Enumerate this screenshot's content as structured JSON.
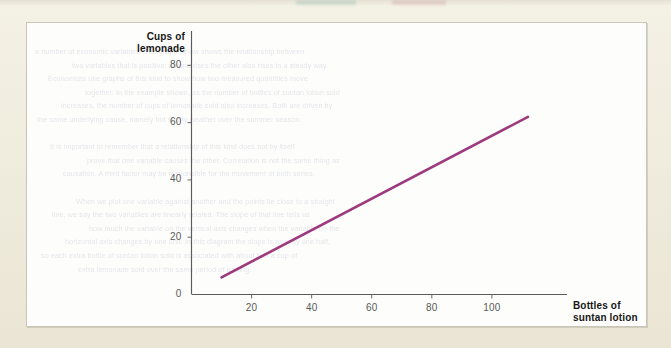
{
  "figure": {
    "background_color": "#f1eee1",
    "panel_color": "#fdfdfb",
    "panel_border_color": "#c9c6b9"
  },
  "axes": {
    "y_title_line1": "Cups of",
    "y_title_line2": "lemonade",
    "x_title_line1": "Bottles of",
    "x_title_line2": "suntan lotion",
    "y_ticks": [
      "0",
      "20",
      "40",
      "60",
      "80"
    ],
    "x_ticks": [
      "20",
      "40",
      "60",
      "80",
      "100"
    ],
    "axis_color": "#5c5c5c",
    "tick_label_color": "#5a5a5a",
    "title_color": "#171717"
  },
  "bleed_text": {
    "lines": [
      "a number of economic variables. The graph below shows the relationship between",
      "two variables that is positive: as one rises the other also rises in a steady way.",
      "Economists use graphs of this kind to show how two measured quantities move",
      "together. In the example shown, as the number of bottles of suntan lotion sold",
      "increases, the number of cups of lemonade sold also increases. Both are driven by",
      "the same underlying cause, namely hot sunny weather over the summer season.",
      "",
      "It is important to remember that a relationship of this kind does not by itself",
      "prove that one variable causes the other. Correlation is not the same thing as",
      "causation. A third factor may be responsible for the movement of both series.",
      "",
      "When we plot one variable against another and the points lie close to a straight",
      "line, we say the two variables are linearly related. The slope of that line tells us",
      "how much the variable on the vertical axis changes when the variable on the",
      "horizontal axis changes by one unit. In this diagram the slope is roughly one half,",
      "so each extra bottle of suntan lotion sold is associated with about half a cup of",
      "extra lemonade sold over the same period of trading."
    ]
  },
  "chart_data": {
    "type": "line",
    "title": "",
    "xlabel": "Bottles of suntan lotion",
    "ylabel": "Cups of lemonade",
    "xlim": [
      0,
      125
    ],
    "ylim": [
      0,
      92
    ],
    "xticks": [
      20,
      40,
      60,
      80,
      100
    ],
    "yticks": [
      0,
      20,
      40,
      60,
      80
    ],
    "grid": false,
    "legend": "none",
    "series": [
      {
        "name": "Cups of lemonade vs bottles of suntan lotion",
        "color": "#9d3a7e",
        "line_width": 2.6,
        "x": [
          10,
          112
        ],
        "y": [
          6,
          62
        ]
      }
    ]
  }
}
